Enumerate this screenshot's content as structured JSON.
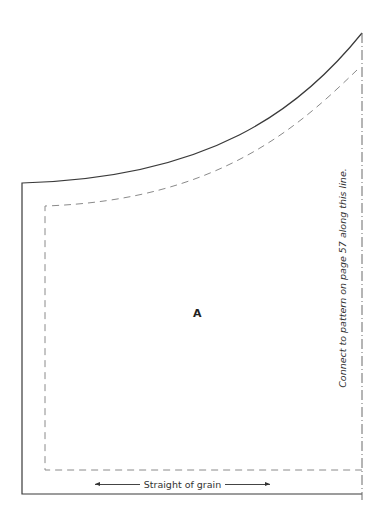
{
  "pattern": {
    "piece_label": "A",
    "grainline_label": "Straight of grain",
    "fold_note": "Connect to pattern on page 57 along this line.",
    "colors": {
      "cut_line": "#3a3a3a",
      "seam_line": "#8a8a8a",
      "join_line": "#6a6a6a",
      "text": "#333333"
    },
    "line_types": {
      "cut_line": "solid",
      "seam_line": "dashed",
      "join_line": "dash-dot"
    }
  }
}
